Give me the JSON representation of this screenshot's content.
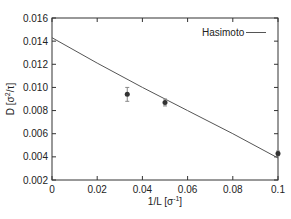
{
  "chart_data": {
    "type": "scatter",
    "title": "",
    "xlabel": "1/L [σ⁻¹]",
    "ylabel": "D [σ²/τ]",
    "xlim": [
      0,
      0.1
    ],
    "ylim": [
      0.002,
      0.016
    ],
    "xticks": [
      "0",
      "0.02",
      "0.04",
      "0.06",
      "0.08",
      "0.1"
    ],
    "yticks": [
      "0.002",
      "0.004",
      "0.006",
      "0.008",
      "0.010",
      "0.012",
      "0.014",
      "0.016"
    ],
    "grid": false,
    "legend_position": "top-right",
    "series": [
      {
        "name": "simulation",
        "type": "scatter",
        "x": [
          0.0333,
          0.05,
          0.1
        ],
        "y": [
          0.0094,
          0.0087,
          0.0043
        ],
        "yerr": [
          0.0006,
          0.0003,
          0.0002
        ],
        "color": "#333333"
      },
      {
        "name": "Hasimoto",
        "type": "line",
        "x": [
          0,
          0.02,
          0.04,
          0.06,
          0.08,
          0.1
        ],
        "y": [
          0.0143,
          0.0121,
          0.01,
          0.008,
          0.006,
          0.0039
        ],
        "color": "#555555"
      }
    ]
  },
  "legend": {
    "label": "Hasimoto"
  },
  "axes": {
    "xlabel_main": "1/L [σ",
    "xlabel_sup": "-1",
    "xlabel_end": "]",
    "ylabel_main": "D [σ",
    "ylabel_sup": "2",
    "ylabel_end": "/τ]"
  }
}
